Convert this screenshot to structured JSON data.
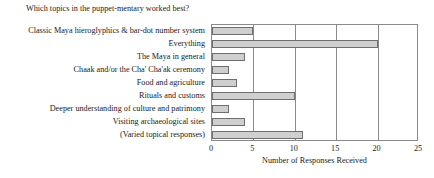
{
  "chart_data": {
    "type": "bar",
    "orientation": "horizontal",
    "title": "Which topics in the puppet-mentary worked best?",
    "xlabel": "Number of Responses Received",
    "ylabel": "",
    "xlim": [
      0,
      25
    ],
    "xticks": [
      0,
      5,
      10,
      15,
      20,
      25
    ],
    "grid": "vertical",
    "legend": null,
    "categories": [
      "Classic Maya hieroglyphics & bar-dot number system",
      "Everything",
      "The Maya in general",
      "Chaak and/or the Cha' Cha'ak ceremony",
      "Food and agriculture",
      "Rituals and customs",
      "Deeper understanding of culture and patrimony",
      "Visiting archaeological sites",
      "(Varied topical responses)"
    ],
    "values": [
      5,
      20,
      4,
      2,
      3,
      10,
      2,
      4,
      11
    ],
    "bar_fill_color": "#cfcfcf",
    "bar_edge_color": "#6e6e6e",
    "axis_color": "#8a8a8a"
  }
}
